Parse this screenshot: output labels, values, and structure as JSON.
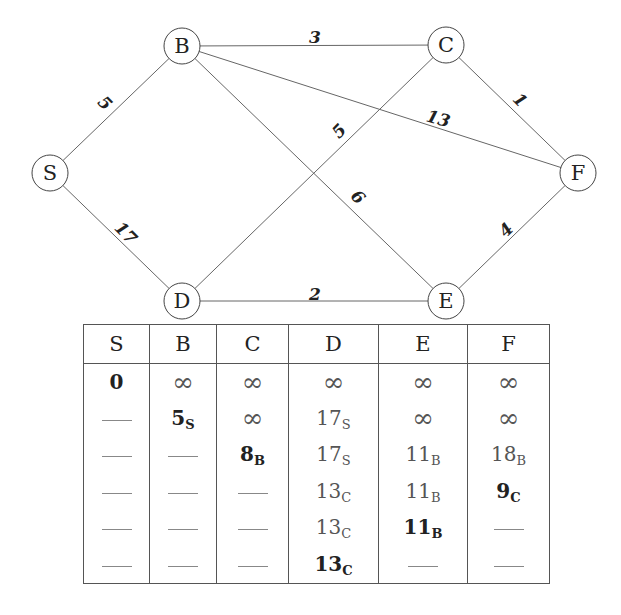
{
  "graph": {
    "nodes": [
      {
        "id": "S",
        "label": "S",
        "x": 50,
        "y": 173
      },
      {
        "id": "B",
        "label": "B",
        "x": 182,
        "y": 46
      },
      {
        "id": "C",
        "label": "C",
        "x": 446,
        "y": 45
      },
      {
        "id": "D",
        "label": "D",
        "x": 182,
        "y": 301
      },
      {
        "id": "E",
        "label": "E",
        "x": 446,
        "y": 301
      },
      {
        "id": "F",
        "label": "F",
        "x": 578,
        "y": 173
      }
    ],
    "edges": [
      {
        "from": "S",
        "to": "B",
        "weight": "5",
        "lx": 104,
        "ly": 104,
        "rot": 45
      },
      {
        "from": "S",
        "to": "D",
        "weight": "17",
        "lx": 125,
        "ly": 234,
        "rot": 45
      },
      {
        "from": "B",
        "to": "C",
        "weight": "3",
        "lx": 315,
        "ly": 38,
        "rot": 0
      },
      {
        "from": "B",
        "to": "F",
        "weight": "13",
        "lx": 438,
        "ly": 120,
        "rot": 16
      },
      {
        "from": "B",
        "to": "E",
        "weight": "6",
        "lx": 357,
        "ly": 198,
        "rot": 45
      },
      {
        "from": "C",
        "to": "D",
        "weight": "5",
        "lx": 340,
        "ly": 132,
        "rot": -45
      },
      {
        "from": "C",
        "to": "F",
        "weight": "1",
        "lx": 519,
        "ly": 101,
        "rot": 45
      },
      {
        "from": "D",
        "to": "E",
        "weight": "2",
        "lx": 315,
        "ly": 295,
        "rot": 0
      },
      {
        "from": "E",
        "to": "F",
        "weight": "4",
        "lx": 507,
        "ly": 231,
        "rot": -45
      }
    ]
  },
  "table": {
    "headers": [
      "S",
      "B",
      "C",
      "D",
      "E",
      "F"
    ],
    "column_widths": [
      65,
      66,
      71,
      89,
      88,
      81
    ],
    "rows": [
      [
        {
          "v": "0",
          "s": "",
          "t": "final"
        },
        {
          "v": "∞",
          "t": "inf"
        },
        {
          "v": "∞",
          "t": "inf"
        },
        {
          "v": "∞",
          "t": "inf"
        },
        {
          "v": "∞",
          "t": "inf"
        },
        {
          "v": "∞",
          "t": "inf"
        }
      ],
      [
        {
          "t": "dash"
        },
        {
          "v": "5",
          "s": "S",
          "t": "final"
        },
        {
          "v": "∞",
          "t": "inf"
        },
        {
          "v": "17",
          "s": "S",
          "t": "tentative"
        },
        {
          "v": "∞",
          "t": "inf"
        },
        {
          "v": "∞",
          "t": "inf"
        }
      ],
      [
        {
          "t": "dash"
        },
        {
          "t": "dash"
        },
        {
          "v": "8",
          "s": "B",
          "t": "final"
        },
        {
          "v": "17",
          "s": "S",
          "t": "tentative"
        },
        {
          "v": "11",
          "s": "B",
          "t": "tentative"
        },
        {
          "v": "18",
          "s": "B",
          "t": "tentative"
        }
      ],
      [
        {
          "t": "dash"
        },
        {
          "t": "dash"
        },
        {
          "t": "dash"
        },
        {
          "v": "13",
          "s": "C",
          "t": "tentative"
        },
        {
          "v": "11",
          "s": "B",
          "t": "tentative"
        },
        {
          "v": "9",
          "s": "C",
          "t": "final"
        }
      ],
      [
        {
          "t": "dash"
        },
        {
          "t": "dash"
        },
        {
          "t": "dash"
        },
        {
          "v": "13",
          "s": "C",
          "t": "tentative"
        },
        {
          "v": "11",
          "s": "B",
          "t": "final"
        },
        {
          "t": "dash"
        }
      ],
      [
        {
          "t": "dash"
        },
        {
          "t": "dash"
        },
        {
          "t": "dash"
        },
        {
          "v": "13",
          "s": "C",
          "t": "final"
        },
        {
          "t": "dash"
        },
        {
          "t": "dash"
        }
      ]
    ]
  }
}
